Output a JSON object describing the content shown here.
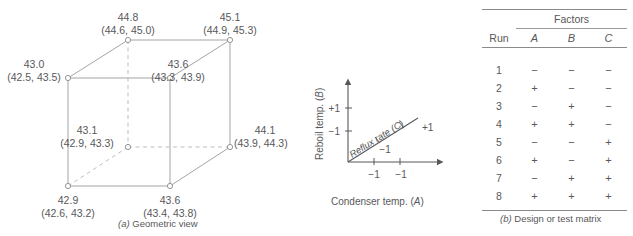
{
  "figure": {
    "panel_a": {
      "caption_marker": "(a)",
      "caption_text": " Geometric view",
      "vertices": [
        {
          "id": "front-bottom-left",
          "mean": "42.9",
          "range": "(42.6, 43.2)"
        },
        {
          "id": "front-bottom-right",
          "mean": "43.6",
          "range": "(43.4, 43.8)"
        },
        {
          "id": "front-top-left",
          "mean": "43.0",
          "range": "(42.5, 43.5)"
        },
        {
          "id": "front-top-right",
          "mean": "43.6",
          "range": "(43.3, 43.9)"
        },
        {
          "id": "back-bottom-left",
          "mean": "43.1",
          "range": "(42.9, 43.3)"
        },
        {
          "id": "back-bottom-right",
          "mean": "44.1",
          "range": "(43.9, 44.3)"
        },
        {
          "id": "back-top-left",
          "mean": "44.8",
          "range": "(44.6, 45.0)"
        },
        {
          "id": "back-top-right",
          "mean": "45.1",
          "range": "(44.9, 45.3)"
        }
      ]
    },
    "panel_axes": {
      "y_axis_label_text": "Reboil temp. (",
      "y_axis_label_factor": "B",
      "y_axis_label_close": ")",
      "x_axis_label_text": "Condenser temp. (",
      "x_axis_label_factor": "A",
      "x_axis_label_close": ")",
      "z_axis_label": "Reflux rate (C)",
      "y_ticks": [
        "+1",
        "−1"
      ],
      "x_ticks": [
        "−1",
        "+1"
      ],
      "z_ticks": [
        "−1",
        "+1"
      ]
    },
    "panel_b": {
      "group_header": "Factors",
      "columns": [
        "Run",
        "A",
        "B",
        "C"
      ],
      "rows": [
        {
          "run": "1",
          "A": "−",
          "B": "−",
          "C": "−"
        },
        {
          "run": "2",
          "A": "+",
          "B": "−",
          "C": "−"
        },
        {
          "run": "3",
          "A": "−",
          "B": "+",
          "C": "−"
        },
        {
          "run": "4",
          "A": "+",
          "B": "+",
          "C": "−"
        },
        {
          "run": "5",
          "A": "−",
          "B": "−",
          "C": "+"
        },
        {
          "run": "6",
          "A": "+",
          "B": "−",
          "C": "+"
        },
        {
          "run": "7",
          "A": "−",
          "B": "+",
          "C": "+"
        },
        {
          "run": "8",
          "A": "+",
          "B": "+",
          "C": "+"
        }
      ],
      "caption_marker": "(b)",
      "caption_text": " Design or test matrix"
    }
  },
  "colors": {
    "line": "#9a9a9c",
    "text": "#58585a",
    "rule": "#8a8a8c"
  }
}
